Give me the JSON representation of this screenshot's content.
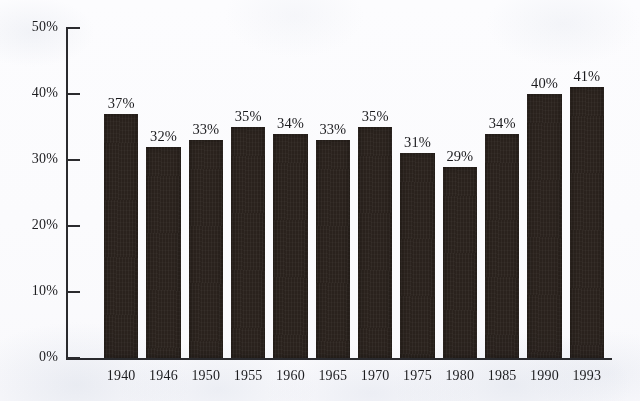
{
  "chart_data": {
    "type": "bar",
    "title": "",
    "subtitle": "",
    "xlabel": "",
    "ylabel": "",
    "categories": [
      "1940",
      "1946",
      "1950",
      "1955",
      "1960",
      "1965",
      "1970",
      "1975",
      "1980",
      "1985",
      "1990",
      "1993"
    ],
    "values": [
      37,
      32,
      33,
      35,
      34,
      33,
      35,
      31,
      29,
      34,
      40,
      41
    ],
    "data_labels": [
      "37%",
      "32%",
      "33%",
      "35%",
      "34%",
      "33%",
      "35%",
      "31%",
      "29%",
      "34%",
      "40%",
      "41%"
    ],
    "ylim": [
      0,
      50
    ],
    "ytick_values": [
      0,
      10,
      20,
      30,
      40,
      50
    ],
    "ytick_labels": [
      "0%",
      "10%",
      "20%",
      "30%",
      "40%",
      "50%"
    ],
    "grid": false,
    "legend": null,
    "legend_position": "none",
    "annotations": [],
    "bar_color": "#2a221d",
    "axis_color": "#2b2b2e",
    "background_color": "#fdfdfe"
  }
}
